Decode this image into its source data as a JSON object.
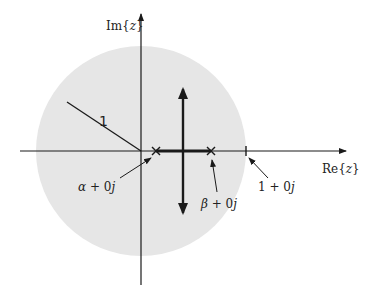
{
  "diagram": {
    "colors": {
      "unit_circle_fill": "#e6e6e6",
      "ink": "#1a1a1a",
      "background": "#ffffff"
    },
    "axes": {
      "real_label_prefix": "Re{",
      "real_label_var": "z",
      "real_label_suffix": "}",
      "imag_label_prefix": "Im{",
      "imag_label_var": "z",
      "imag_label_suffix": "}"
    },
    "radius_label": "1",
    "poles": [
      {
        "name": "alpha",
        "symbol": "α",
        "rest": " + 0",
        "j": "j"
      },
      {
        "name": "beta",
        "symbol": "β",
        "rest": " + 0",
        "j": "j"
      }
    ],
    "unit_point": {
      "prefix": "1 + 0",
      "j": "j"
    }
  }
}
